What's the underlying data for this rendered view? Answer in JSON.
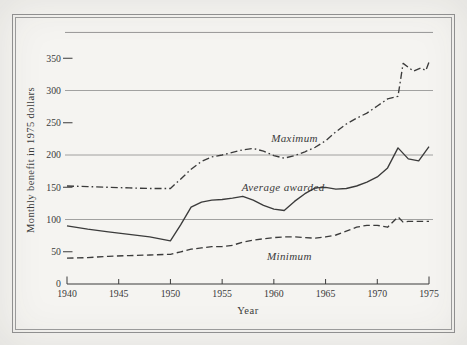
{
  "figure": {
    "paper_color": "#f5f4f1",
    "frame_color": "#8f8f8f",
    "ink_color": "#3b3b3b",
    "grid_color": "#8c8c8c"
  },
  "chart_data": {
    "type": "line",
    "title": "",
    "xlabel": "Year",
    "ylabel": "Monthly benefit in 1975 dollars",
    "xlim": [
      1940,
      1975
    ],
    "ylim": [
      0,
      390
    ],
    "grid": "horizontal-only",
    "legend_position": "inline-labels",
    "x_ticks": [
      1940,
      1945,
      1950,
      1955,
      1960,
      1965,
      1970,
      1975
    ],
    "y_ticks_labeled": [
      0,
      50,
      100,
      150,
      200,
      250,
      300,
      350
    ],
    "y_gridlines": [
      100,
      200,
      300
    ],
    "y_short_ticks": [
      50,
      150,
      250,
      350
    ],
    "y_top_border": 390,
    "series": [
      {
        "name": "Maximum",
        "style": "dash-dot",
        "label_x": 1962.0,
        "label_y": 225,
        "points": [
          [
            1940,
            152
          ],
          [
            1942,
            151
          ],
          [
            1944,
            150
          ],
          [
            1946,
            149
          ],
          [
            1948,
            148
          ],
          [
            1950,
            148
          ],
          [
            1951,
            163
          ],
          [
            1952,
            178
          ],
          [
            1953,
            190
          ],
          [
            1954,
            197
          ],
          [
            1955,
            200
          ],
          [
            1956,
            204
          ],
          [
            1957,
            208
          ],
          [
            1958,
            210
          ],
          [
            1959,
            206
          ],
          [
            1960,
            199
          ],
          [
            1961,
            195
          ],
          [
            1962,
            199
          ],
          [
            1963,
            205
          ],
          [
            1964,
            212
          ],
          [
            1965,
            222
          ],
          [
            1966,
            236
          ],
          [
            1967,
            248
          ],
          [
            1968,
            257
          ],
          [
            1969,
            265
          ],
          [
            1970,
            276
          ],
          [
            1971,
            287
          ],
          [
            1972,
            291
          ],
          [
            1972.5,
            342
          ],
          [
            1973.5,
            330
          ],
          [
            1974.2,
            335
          ],
          [
            1974.7,
            331
          ],
          [
            1975,
            344
          ]
        ]
      },
      {
        "name": "Average awarded",
        "style": "solid",
        "label_x": 1960.9,
        "label_y": 149,
        "points": [
          [
            1940,
            90
          ],
          [
            1942,
            85
          ],
          [
            1944,
            81
          ],
          [
            1946,
            77
          ],
          [
            1948,
            73
          ],
          [
            1950,
            67
          ],
          [
            1951,
            92
          ],
          [
            1952,
            119
          ],
          [
            1953,
            127
          ],
          [
            1954,
            130
          ],
          [
            1955,
            131
          ],
          [
            1956,
            133
          ],
          [
            1957,
            136
          ],
          [
            1958,
            130
          ],
          [
            1959,
            122
          ],
          [
            1960,
            116
          ],
          [
            1961,
            114
          ],
          [
            1962,
            128
          ],
          [
            1963,
            140
          ],
          [
            1964,
            149
          ],
          [
            1965,
            150
          ],
          [
            1966,
            147
          ],
          [
            1967,
            148
          ],
          [
            1968,
            152
          ],
          [
            1969,
            158
          ],
          [
            1970,
            166
          ],
          [
            1971,
            180
          ],
          [
            1972,
            211
          ],
          [
            1973,
            194
          ],
          [
            1974,
            191
          ],
          [
            1975,
            213
          ]
        ]
      },
      {
        "name": "Minimum",
        "style": "dashed",
        "label_x": 1961.5,
        "label_y": 43,
        "points": [
          [
            1940,
            40
          ],
          [
            1942,
            41
          ],
          [
            1944,
            43
          ],
          [
            1946,
            44
          ],
          [
            1948,
            45
          ],
          [
            1950,
            46
          ],
          [
            1951,
            50
          ],
          [
            1952,
            54
          ],
          [
            1953,
            56
          ],
          [
            1954,
            58
          ],
          [
            1955,
            58
          ],
          [
            1956,
            60
          ],
          [
            1957,
            65
          ],
          [
            1958,
            68
          ],
          [
            1959,
            70
          ],
          [
            1960,
            72
          ],
          [
            1961,
            73
          ],
          [
            1962,
            73
          ],
          [
            1963,
            72
          ],
          [
            1964,
            71
          ],
          [
            1965,
            73
          ],
          [
            1966,
            76
          ],
          [
            1967,
            82
          ],
          [
            1968,
            88
          ],
          [
            1969,
            91
          ],
          [
            1970,
            91
          ],
          [
            1971,
            88
          ],
          [
            1972,
            104
          ],
          [
            1972.5,
            96
          ],
          [
            1973,
            97
          ],
          [
            1974,
            97
          ],
          [
            1975,
            97
          ]
        ]
      }
    ]
  }
}
